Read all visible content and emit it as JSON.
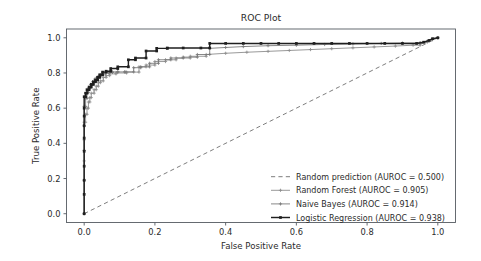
{
  "chart_data": {
    "type": "line",
    "title": "ROC Plot",
    "xlabel": "False Positive Rate",
    "ylabel": "True Positive Rate",
    "xlim": [
      -0.05,
      1.05
    ],
    "ylim": [
      -0.05,
      1.05
    ],
    "xticks": [
      "0.0",
      "0.2",
      "0.4",
      "0.6",
      "0.8",
      "1.0"
    ],
    "xtick_values": [
      0.0,
      0.2,
      0.4,
      0.6,
      0.8,
      1.0
    ],
    "yticks": [
      "0.0",
      "0.2",
      "0.4",
      "0.6",
      "0.8",
      "1.0"
    ],
    "ytick_values": [
      0.0,
      0.2,
      0.4,
      0.6,
      0.8,
      1.0
    ],
    "grid": false,
    "legend_position": "lower right",
    "legend_frame": false,
    "series": [
      {
        "name": "random-prediction",
        "label": "Random prediction (AUROC = 0.500)",
        "auroc": 0.5,
        "color": "#6e6e6e",
        "linestyle": "dashed",
        "linewidth": 0.9,
        "marker": "none",
        "x": [
          0.0,
          1.0
        ],
        "y": [
          0.0,
          1.0
        ]
      },
      {
        "name": "random-forest",
        "label": "Random Forest (AUROC = 0.905)",
        "auroc": 0.905,
        "color": "#8d8d8d",
        "linestyle": "solid",
        "linewidth": 0.9,
        "marker": "plus",
        "x": [
          0.0,
          0.0,
          0.0,
          0.0,
          0.004,
          0.004,
          0.008,
          0.008,
          0.012,
          0.012,
          0.016,
          0.016,
          0.02,
          0.02,
          0.028,
          0.028,
          0.034,
          0.034,
          0.04,
          0.04,
          0.046,
          0.046,
          0.054,
          0.054,
          0.062,
          0.062,
          0.072,
          0.072,
          0.09,
          0.09,
          0.12,
          0.12,
          0.155,
          0.155,
          0.175,
          0.175,
          0.2,
          0.2,
          0.23,
          0.23,
          0.26,
          0.26,
          0.3,
          0.3,
          0.345,
          0.345,
          0.4,
          0.46,
          0.52,
          0.58,
          0.64,
          0.7,
          0.76,
          0.82,
          0.88,
          0.93,
          0.95,
          0.95,
          0.97,
          0.985,
          1.0
        ],
        "y": [
          0.0,
          0.3,
          0.42,
          0.52,
          0.52,
          0.565,
          0.565,
          0.6,
          0.6,
          0.635,
          0.635,
          0.66,
          0.66,
          0.685,
          0.685,
          0.705,
          0.705,
          0.725,
          0.725,
          0.745,
          0.745,
          0.755,
          0.755,
          0.775,
          0.775,
          0.785,
          0.785,
          0.795,
          0.795,
          0.8,
          0.8,
          0.805,
          0.805,
          0.835,
          0.835,
          0.845,
          0.845,
          0.865,
          0.865,
          0.875,
          0.875,
          0.885,
          0.885,
          0.895,
          0.895,
          0.905,
          0.912,
          0.918,
          0.923,
          0.928,
          0.933,
          0.938,
          0.943,
          0.948,
          0.953,
          0.958,
          0.958,
          0.965,
          0.975,
          0.99,
          1.0
        ]
      },
      {
        "name": "naive-bayes",
        "label": "Naive Bayes (AUROC = 0.914)",
        "auroc": 0.914,
        "color": "#7a7a7a",
        "linestyle": "solid",
        "linewidth": 0.9,
        "marker": "plus",
        "x": [
          0.0,
          0.0,
          0.0,
          0.0,
          0.0,
          0.004,
          0.004,
          0.008,
          0.008,
          0.012,
          0.012,
          0.018,
          0.018,
          0.024,
          0.024,
          0.03,
          0.03,
          0.036,
          0.036,
          0.042,
          0.042,
          0.05,
          0.05,
          0.06,
          0.06,
          0.07,
          0.07,
          0.08,
          0.08,
          0.095,
          0.095,
          0.115,
          0.115,
          0.14,
          0.14,
          0.16,
          0.16,
          0.185,
          0.185,
          0.21,
          0.21,
          0.245,
          0.245,
          0.28,
          0.28,
          0.32,
          0.32,
          0.355,
          0.355,
          0.4,
          0.45,
          0.52,
          0.6,
          0.68,
          0.76,
          0.84,
          0.9,
          0.95,
          0.95,
          0.97,
          0.985,
          1.0
        ],
        "y": [
          0.0,
          0.19,
          0.36,
          0.5,
          0.61,
          0.61,
          0.655,
          0.655,
          0.69,
          0.69,
          0.715,
          0.715,
          0.735,
          0.735,
          0.75,
          0.75,
          0.765,
          0.765,
          0.775,
          0.775,
          0.785,
          0.785,
          0.795,
          0.795,
          0.8,
          0.8,
          0.803,
          0.803,
          0.806,
          0.806,
          0.806,
          0.806,
          0.806,
          0.806,
          0.83,
          0.83,
          0.835,
          0.835,
          0.855,
          0.855,
          0.875,
          0.875,
          0.885,
          0.885,
          0.89,
          0.89,
          0.905,
          0.905,
          0.94,
          0.945,
          0.95,
          0.955,
          0.958,
          0.962,
          0.965,
          0.968,
          0.97,
          0.97,
          0.972,
          0.98,
          0.99,
          1.0
        ]
      },
      {
        "name": "logistic-regression",
        "label": "Logistic Regression (AUROC = 0.938)",
        "auroc": 0.938,
        "color": "#1f1f1f",
        "linestyle": "solid",
        "linewidth": 1.45,
        "marker": "square",
        "x": [
          0.0,
          0.0,
          0.0,
          0.0,
          0.0,
          0.0,
          0.0,
          0.0,
          0.0,
          0.0,
          0.004,
          0.004,
          0.008,
          0.008,
          0.014,
          0.014,
          0.02,
          0.02,
          0.026,
          0.026,
          0.032,
          0.032,
          0.038,
          0.038,
          0.044,
          0.044,
          0.052,
          0.052,
          0.062,
          0.062,
          0.075,
          0.075,
          0.095,
          0.095,
          0.125,
          0.125,
          0.145,
          0.145,
          0.175,
          0.175,
          0.205,
          0.205,
          0.235,
          0.235,
          0.28,
          0.33,
          0.355,
          0.355,
          0.4,
          0.45,
          0.5,
          0.55,
          0.6,
          0.65,
          0.7,
          0.75,
          0.8,
          0.85,
          0.9,
          0.94,
          0.96,
          0.975,
          0.985,
          1.0
        ],
        "y": [
          0.0,
          0.11,
          0.19,
          0.27,
          0.355,
          0.43,
          0.5,
          0.555,
          0.6,
          0.665,
          0.665,
          0.685,
          0.685,
          0.705,
          0.705,
          0.72,
          0.72,
          0.735,
          0.735,
          0.75,
          0.75,
          0.76,
          0.76,
          0.775,
          0.775,
          0.79,
          0.79,
          0.805,
          0.805,
          0.81,
          0.81,
          0.825,
          0.825,
          0.835,
          0.835,
          0.875,
          0.875,
          0.885,
          0.885,
          0.925,
          0.925,
          0.94,
          0.94,
          0.942,
          0.942,
          0.942,
          0.942,
          0.968,
          0.968,
          0.968,
          0.968,
          0.968,
          0.968,
          0.968,
          0.968,
          0.968,
          0.968,
          0.968,
          0.968,
          0.968,
          0.975,
          0.985,
          0.995,
          1.0
        ]
      }
    ],
    "legend_entries": [
      "Random prediction (AUROC = 0.500)",
      "Random Forest (AUROC = 0.905)",
      "Naive Bayes (AUROC = 0.914)",
      "Logistic Regression (AUROC = 0.938)"
    ]
  }
}
